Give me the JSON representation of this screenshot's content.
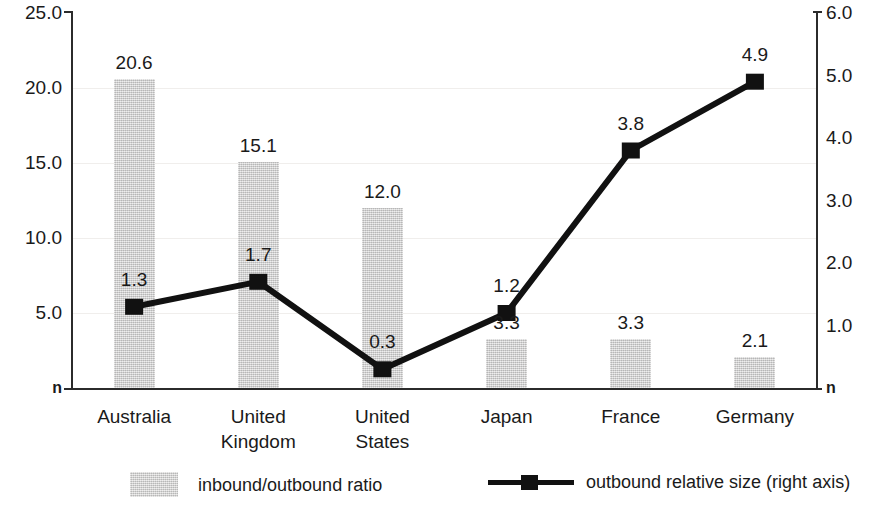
{
  "chart_data": {
    "type": "bar",
    "title": "",
    "subtitle": "",
    "xlabel": "",
    "ylabel": "",
    "categories": [
      "Australia",
      "United Kingdom",
      "United States",
      "Japan",
      "France",
      "Germany"
    ],
    "category_lines": [
      [
        "Australia"
      ],
      [
        "United",
        "Kingdom"
      ],
      [
        "United",
        "States"
      ],
      [
        "Japan"
      ],
      [
        "France"
      ],
      [
        "Germany"
      ]
    ],
    "grid": true,
    "legend_position": "bottom",
    "series": [
      {
        "name": "inbound/outbound ratio",
        "type": "bar",
        "axis": "left",
        "values": [
          20.6,
          15.1,
          12.0,
          3.3,
          3.3,
          2.1
        ],
        "labels": [
          "20.6",
          "15.1",
          "12.0",
          "3.3",
          "3.3",
          "2.1"
        ],
        "color": "#cccbcb"
      },
      {
        "name": "outbound relative size (right axis)",
        "type": "line",
        "axis": "right",
        "values": [
          1.3,
          1.7,
          0.3,
          1.2,
          3.8,
          4.9
        ],
        "labels": [
          "1.3",
          "1.7",
          "0.3",
          "1.2",
          "3.8",
          "4.9"
        ],
        "color": "#111111",
        "marker": "square"
      }
    ],
    "left_axis": {
      "min": 0,
      "max": 25,
      "ticks": [
        25.0,
        20.0,
        15.0,
        10.0,
        5.0,
        0
      ],
      "tick_labels": [
        "25.0",
        "20.0",
        "15.0",
        "10.0",
        "5.0",
        "n"
      ],
      "zero_label": "n"
    },
    "right_axis": {
      "min": 0,
      "max": 6,
      "ticks": [
        6.0,
        5.0,
        4.0,
        3.0,
        2.0,
        1.0,
        0
      ],
      "tick_labels": [
        "6.0",
        "5.0",
        "4.0",
        "3.0",
        "2.0",
        "1.0",
        "n"
      ],
      "zero_label": "n"
    },
    "legend": [
      {
        "label": "inbound/outbound ratio",
        "marker": "swatch"
      },
      {
        "label": "outbound relative size (right axis)",
        "marker": "line-square"
      }
    ]
  }
}
